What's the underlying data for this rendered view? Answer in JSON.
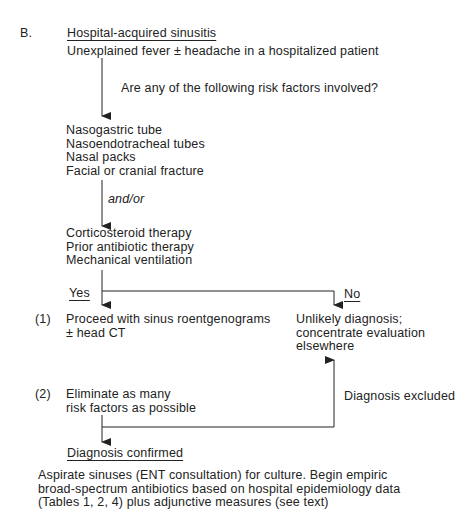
{
  "diagram": {
    "section_label": "B.",
    "title": "Hospital-acquired sinusitis",
    "presentation": "Unexplained fever ± headache in a hospitalized patient",
    "question": "Are any of the following risk factors involved?",
    "risk_group_1": [
      "Nasogastric tube",
      "Nasoendotracheal tubes",
      "Nasal packs",
      "Facial or cranial fracture"
    ],
    "connector_label": "and/or",
    "risk_group_2": [
      "Corticosteroid therapy",
      "Prior antibiotic therapy",
      "Mechanical ventilation"
    ],
    "yes_label": "Yes",
    "no_label": "No",
    "step1_number": "(1)",
    "step1_lines": [
      "Proceed with sinus roentgenograms",
      "± head CT"
    ],
    "no_outcome_lines": [
      "Unlikely diagnosis;",
      "concentrate evaluation",
      "elsewhere"
    ],
    "step2_number": "(2)",
    "step2_lines": [
      "Eliminate as many",
      "risk factors as possible"
    ],
    "excluded_label": "Diagnosis excluded",
    "confirmed_label": "Diagnosis confirmed",
    "conclusion_lines": [
      "Aspirate sinuses (ENT consultation) for culture. Begin empiric",
      "broad-spectrum antibiotics based on hospital epidemiology data",
      "(Tables 1, 2, 4) plus adjunctive measures (see text)"
    ]
  }
}
